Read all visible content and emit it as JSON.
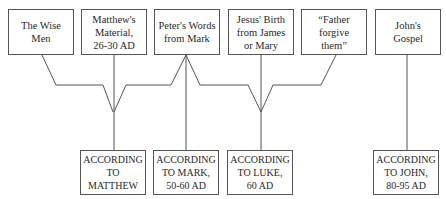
{
  "sources": [
    {
      "label": "The Wise\nMen"
    },
    {
      "label": "Matthew's\nMaterial,\n26-30 AD"
    },
    {
      "label": "Peter's Words\nfrom Mark"
    },
    {
      "label": "Jesus' Birth\nfrom James\nor Mary"
    },
    {
      "label": "“Father forgive\nthem”"
    },
    {
      "label": "John's\nGospel"
    }
  ],
  "gospels": [
    {
      "label": "ACCORDING\nTO MATTHEW"
    },
    {
      "label": "ACCORDING\nTO MARK,\n50-60 AD"
    },
    {
      "label": "ACCORDING\nTO LUKE,\n60 AD"
    },
    {
      "label": "ACCORDING\nTO JOHN,\n80-95 AD"
    }
  ]
}
